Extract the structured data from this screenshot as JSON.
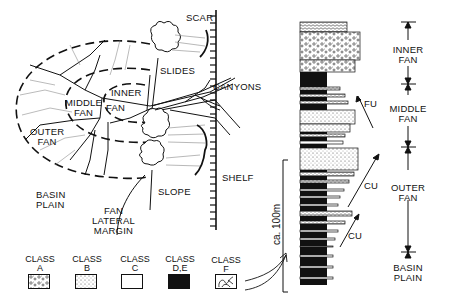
{
  "map_labels": {
    "scar": "SCAR",
    "slides": "SLIDES",
    "canyons": "CANYONS",
    "inner": "INNER",
    "middle_fan": [
      "MIDDLE",
      "FAN"
    ],
    "fan": "FAN",
    "outer_fan": [
      "OUTER",
      "FAN"
    ],
    "shelf": "SHELF",
    "basin_plain": [
      "BASIN",
      "PLAIN"
    ],
    "slope": "SLOPE",
    "fan_lateral_margin": [
      "FAN",
      "LATERAL",
      "MARGIN"
    ]
  },
  "legend": [
    {
      "title": "CLASS",
      "sub": "A",
      "pattern": "conglomerate"
    },
    {
      "title": "CLASS",
      "sub": "B",
      "pattern": "sandstone"
    },
    {
      "title": "CLASS",
      "sub": "C",
      "pattern": "white"
    },
    {
      "title": "CLASS",
      "sub": "D,E",
      "pattern": "black"
    },
    {
      "title": "CLASS",
      "sub": "F",
      "pattern": "slump"
    }
  ],
  "column": {
    "scale_label": "ca. 100m",
    "trend_labels": [
      "FU",
      "CU",
      "CU"
    ]
  },
  "facies_zones": [
    [
      "INNER",
      "FAN"
    ],
    [
      "MIDDLE",
      "FAN"
    ],
    [
      "OUTER",
      "FAN"
    ],
    [
      "BASIN",
      "PLAIN"
    ]
  ]
}
